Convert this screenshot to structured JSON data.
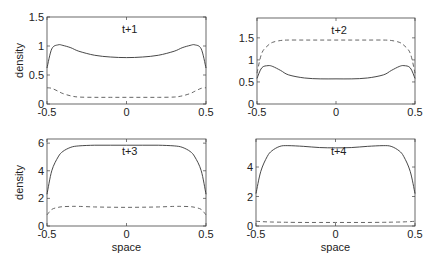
{
  "figure": {
    "ylabel": "density",
    "xlabel": "space",
    "line_color": "#333333",
    "dash_color": "#555555"
  },
  "chart_data": [
    {
      "type": "line",
      "title": "t+1",
      "xlabel": "",
      "ylabel": "density",
      "xlim": [
        -0.5,
        0.5
      ],
      "ylim": [
        0,
        1.5
      ],
      "xticks": [
        "-0.5",
        "0",
        "0.5"
      ],
      "yticks": [
        "0",
        "0.5",
        "1",
        "1.5"
      ],
      "x": [
        -0.5,
        -0.47,
        -0.43,
        -0.4,
        -0.35,
        -0.3,
        -0.2,
        -0.1,
        0,
        0.1,
        0.2,
        0.3,
        0.35,
        0.4,
        0.43,
        0.47,
        0.5
      ],
      "series": [
        {
          "name": "solid",
          "style": "solid",
          "values": [
            0.62,
            0.95,
            1.02,
            1.01,
            0.97,
            0.91,
            0.84,
            0.81,
            0.8,
            0.81,
            0.84,
            0.91,
            0.97,
            1.01,
            1.02,
            0.95,
            0.62
          ]
        },
        {
          "name": "dashed",
          "style": "dashed",
          "values": [
            0.28,
            0.27,
            0.22,
            0.18,
            0.14,
            0.12,
            0.115,
            0.115,
            0.115,
            0.115,
            0.115,
            0.12,
            0.14,
            0.18,
            0.22,
            0.27,
            0.28
          ]
        }
      ]
    },
    {
      "type": "line",
      "title": "t+2",
      "xlabel": "",
      "ylabel": "",
      "xlim": [
        -0.5,
        0.5
      ],
      "ylim": [
        0,
        1.95
      ],
      "xticks": [
        "-0.5",
        "0",
        "0.5"
      ],
      "yticks": [
        "0",
        "0.5",
        "1",
        "1.5"
      ],
      "x": [
        -0.5,
        -0.47,
        -0.43,
        -0.4,
        -0.35,
        -0.3,
        -0.2,
        -0.1,
        0,
        0.1,
        0.2,
        0.3,
        0.35,
        0.4,
        0.43,
        0.47,
        0.5
      ],
      "series": [
        {
          "name": "solid",
          "style": "solid",
          "values": [
            0.58,
            0.82,
            0.87,
            0.85,
            0.76,
            0.66,
            0.59,
            0.57,
            0.57,
            0.57,
            0.59,
            0.66,
            0.76,
            0.85,
            0.87,
            0.82,
            0.58
          ]
        },
        {
          "name": "dashed",
          "style": "dashed",
          "values": [
            0.7,
            1.15,
            1.33,
            1.4,
            1.44,
            1.45,
            1.45,
            1.45,
            1.45,
            1.45,
            1.45,
            1.45,
            1.44,
            1.4,
            1.33,
            1.15,
            0.7
          ]
        }
      ]
    },
    {
      "type": "line",
      "title": "t+3",
      "xlabel": "space",
      "ylabel": "density",
      "xlim": [
        -0.5,
        0.5
      ],
      "ylim": [
        0,
        6.3
      ],
      "xticks": [
        "-0.5",
        "0",
        "0.5"
      ],
      "yticks": [
        "0",
        "2",
        "4",
        "6"
      ],
      "x": [
        -0.5,
        -0.47,
        -0.43,
        -0.4,
        -0.35,
        -0.3,
        -0.2,
        -0.1,
        0,
        0.1,
        0.2,
        0.3,
        0.35,
        0.4,
        0.43,
        0.47,
        0.5
      ],
      "series": [
        {
          "name": "solid",
          "style": "solid",
          "values": [
            2.3,
            4.0,
            5.0,
            5.4,
            5.7,
            5.8,
            5.85,
            5.85,
            5.85,
            5.85,
            5.85,
            5.8,
            5.7,
            5.4,
            5.0,
            4.0,
            2.3
          ]
        },
        {
          "name": "dashed",
          "style": "dashed",
          "values": [
            0.8,
            1.2,
            1.35,
            1.4,
            1.42,
            1.42,
            1.38,
            1.36,
            1.35,
            1.36,
            1.38,
            1.42,
            1.42,
            1.4,
            1.35,
            1.2,
            0.8
          ]
        }
      ]
    },
    {
      "type": "line",
      "title": "t+4",
      "xlabel": "space",
      "ylabel": "",
      "xlim": [
        -0.5,
        0.5
      ],
      "ylim": [
        0,
        5.9
      ],
      "xticks": [
        "-0.5",
        "0",
        "0.5"
      ],
      "yticks": [
        "0",
        "2",
        "4"
      ],
      "x": [
        -0.5,
        -0.47,
        -0.43,
        -0.4,
        -0.35,
        -0.3,
        -0.2,
        -0.1,
        0,
        0.1,
        0.2,
        0.3,
        0.35,
        0.4,
        0.43,
        0.47,
        0.5
      ],
      "series": [
        {
          "name": "solid",
          "style": "solid",
          "values": [
            2.2,
            3.7,
            4.7,
            5.1,
            5.4,
            5.45,
            5.4,
            5.32,
            5.3,
            5.32,
            5.4,
            5.45,
            5.4,
            5.1,
            4.7,
            3.7,
            2.2
          ]
        },
        {
          "name": "dashed",
          "style": "dashed",
          "values": [
            0.32,
            0.3,
            0.28,
            0.27,
            0.26,
            0.25,
            0.24,
            0.24,
            0.24,
            0.24,
            0.24,
            0.25,
            0.26,
            0.27,
            0.28,
            0.3,
            0.32
          ]
        }
      ]
    }
  ]
}
